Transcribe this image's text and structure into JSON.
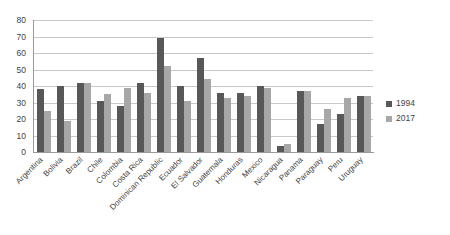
{
  "chart_data": {
    "type": "bar",
    "title": "",
    "xlabel": "",
    "ylabel": "",
    "ylim": [
      0,
      80
    ],
    "ytick_step": 10,
    "yticks": [
      "80",
      "70",
      "60",
      "50",
      "40",
      "30",
      "20",
      "10",
      "0"
    ],
    "grid": true,
    "legend_position": "right",
    "categories": [
      "Argentina",
      "Bolivia",
      "Brazil",
      "Chile",
      "Colombia",
      "Costa Rica",
      "Dominican Republic",
      "Ecuador",
      "El Salvador",
      "Guatemala",
      "Honduras",
      "Mexico",
      "Nicaragua",
      "Panama",
      "Paraguay",
      "Peru",
      "Uruguay"
    ],
    "series": [
      {
        "name": "1994",
        "color": "#585858",
        "values": [
          38,
          40,
          42,
          31,
          28,
          42,
          69,
          40,
          57,
          36,
          36,
          40,
          3.5,
          37,
          17,
          23,
          34
        ]
      },
      {
        "name": "2017",
        "color": "#a7a7a7",
        "values": [
          25,
          19,
          42,
          35,
          39,
          36,
          52,
          31,
          44,
          33,
          34,
          39,
          5,
          37,
          26,
          33,
          34
        ]
      }
    ]
  },
  "legend": {
    "items": [
      {
        "label": "1994",
        "swatch": "legend-swatch-1994"
      },
      {
        "label": "2017",
        "swatch": "legend-swatch-2017"
      }
    ]
  }
}
